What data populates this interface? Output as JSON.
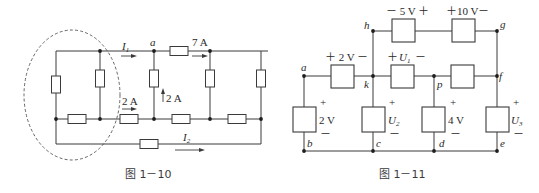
{
  "figures": [
    {
      "id": "fig-1-10",
      "caption": "图 1－10",
      "labels": {
        "node_a": "a",
        "current_I1": "I",
        "current_I1_sub": "1",
        "current_I2": "I",
        "current_I2_sub": "2",
        "current_7A": "7 A",
        "current_2A_horizontal": "2 A",
        "current_2A_vertical": "2 A"
      },
      "elements": {
        "resistor_count": 10,
        "closed_surface": "dashed ellipse around left portion"
      }
    },
    {
      "id": "fig-1-11",
      "caption": "图 1－11",
      "nodes": {
        "a": "a",
        "b": "b",
        "c": "c",
        "d": "d",
        "e": "e",
        "f": "f",
        "g": "g",
        "h": "h",
        "k": "k",
        "p": "p"
      },
      "elements": [
        {
          "between": "h-g (left)",
          "label": "－ 5 V ＋"
        },
        {
          "between": "h-g (right)",
          "label": "＋10 V－"
        },
        {
          "between": "a-k",
          "label": "＋ 2 V －"
        },
        {
          "between": "k-p",
          "label_plus": "＋",
          "label_U": "U",
          "label_sub": "1",
          "label_minus": "－"
        },
        {
          "between": "p-f",
          "label": ""
        },
        {
          "between": "a-b",
          "label": "2 V",
          "plus": "+",
          "minus": "－"
        },
        {
          "between": "k-c",
          "label": "U",
          "sub": "2",
          "plus": "+",
          "minus": "－"
        },
        {
          "between": "p-d",
          "label": "4 V",
          "plus": "+",
          "minus": "－"
        },
        {
          "between": "f-e",
          "label": "U",
          "sub": "3",
          "plus": "+",
          "minus": "－"
        }
      ]
    }
  ]
}
